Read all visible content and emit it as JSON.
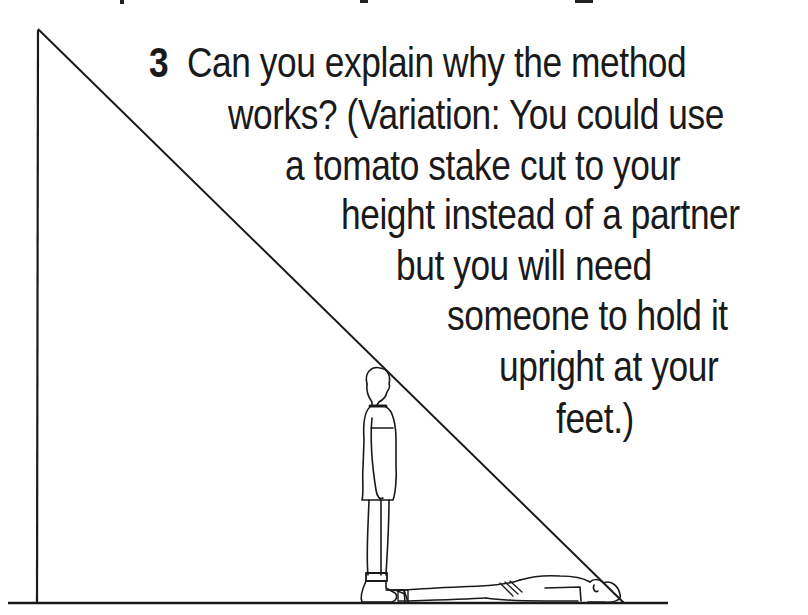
{
  "question": {
    "number": "3",
    "lines": [
      "Can you explain why the method",
      "works? (Variation: You could use",
      "a tomato stake  cut to your",
      "height instead of a partner",
      "but  you  will need",
      "someone to hold it",
      "upright at your",
      "feet.)"
    ]
  },
  "illustration": {
    "description": "Right triangle formed by a tall vertical object and a sight line; a standing person and a person lying on the ground",
    "elements": [
      "vertical-object-line",
      "hypotenuse-sight-line",
      "ground-line",
      "standing-person",
      "lying-person"
    ],
    "line_color": "#1a1a1a"
  }
}
